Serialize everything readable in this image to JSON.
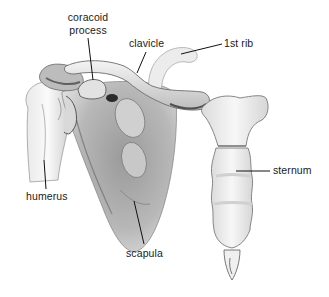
{
  "figure": {
    "colors": {
      "background": "#ffffff",
      "bone_light": "#f2f2f2",
      "bone_mid": "#c9c9c9",
      "bone_shadow": "#7a7a7a",
      "bone_dark": "#2e2e2e",
      "label_text": "#1a1a1a",
      "leader_line": "#111111"
    },
    "labels": {
      "coracoid_line1": "coracoid",
      "coracoid_line2": "process",
      "clavicle": "clavicle",
      "first_rib": "1st rib",
      "humerus": "humerus",
      "scapula": "scapula",
      "sternum": "sternum"
    }
  }
}
